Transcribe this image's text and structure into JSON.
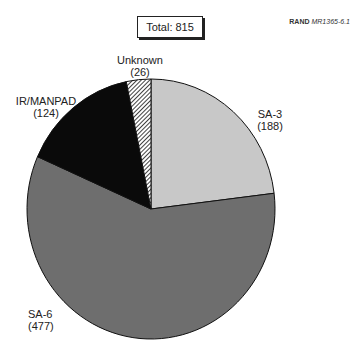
{
  "credit": {
    "org": "RAND",
    "id": "MR1365-6.1"
  },
  "total": {
    "label": "Total:",
    "value": "815"
  },
  "labels": {
    "unknown": {
      "name": "Unknown",
      "count": "(26)"
    },
    "irmanpad": {
      "name": "IR/MANPAD",
      "count": "(124)"
    },
    "sa3": {
      "name": "SA-3",
      "count": "(188)"
    },
    "sa6": {
      "name": "SA-6",
      "count": "(477)"
    }
  },
  "chart_data": {
    "type": "pie",
    "categories": [
      "SA-3",
      "SA-6",
      "IR/MANPAD",
      "Unknown"
    ],
    "values": [
      188,
      477,
      124,
      26
    ],
    "total": 815,
    "colors": [
      "#c8c8c8",
      "#6e6e6e",
      "#0a0a0a",
      "hatched"
    ],
    "start_angle_deg": 90,
    "direction": "clockwise",
    "legend": "none (direct labels)"
  }
}
